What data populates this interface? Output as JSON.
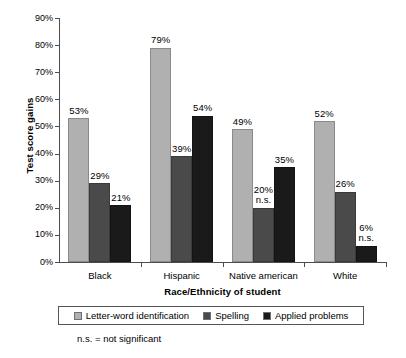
{
  "chart_data": {
    "type": "bar",
    "title": "",
    "xlabel": "Race/Ethnicity of student",
    "ylabel": "Test score gains",
    "categories": [
      "Black",
      "Hispanic",
      "Native american",
      "White"
    ],
    "series": [
      {
        "name": "Letter-word identification",
        "color": "#b0b0b0",
        "values": [
          53,
          79,
          49,
          52
        ]
      },
      {
        "name": "Spelling",
        "color": "#4a4a4a",
        "values": [
          29,
          39,
          20,
          26
        ]
      },
      {
        "name": "Applied problems",
        "color": "#1a1a1a",
        "values": [
          21,
          54,
          35,
          6
        ]
      }
    ],
    "data_labels": [
      [
        "53%",
        "79%",
        "49%",
        "52%"
      ],
      [
        "29%",
        "39%",
        "20%",
        "26%"
      ],
      [
        "21%",
        "54%",
        "35%",
        "6%"
      ]
    ],
    "annotations": [
      [
        "",
        "",
        "",
        ""
      ],
      [
        "",
        "",
        "n.s.",
        ""
      ],
      [
        "",
        "",
        "",
        "n.s."
      ]
    ],
    "ylim": [
      0,
      90
    ],
    "ytick_values": [
      0,
      10,
      20,
      30,
      40,
      50,
      60,
      70,
      80,
      90
    ],
    "ytick_labels": [
      "0%",
      "10%",
      "20%",
      "30%",
      "40%",
      "50%",
      "60%",
      "70%",
      "80%",
      "90%"
    ],
    "grid": false,
    "legend_position": "bottom",
    "footnote": "n.s. = not significant"
  }
}
